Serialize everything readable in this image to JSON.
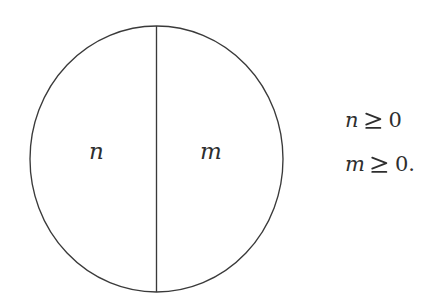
{
  "figure": {
    "width": 443,
    "height": 306,
    "background_color": "#ffffff",
    "stroke_color": "#3a3a3a",
    "text_color": "#2e2e2e",
    "type": "diagram"
  },
  "shape": {
    "name": "circle",
    "center_x": 156.5,
    "center_y": 159,
    "radius_x": 126.5,
    "radius_y": 133,
    "divider": {
      "name": "vertical-diameter",
      "x": 156.5,
      "y_top": 26,
      "y_bottom": 292
    }
  },
  "regions": [
    {
      "id": "left",
      "label": "n"
    },
    {
      "id": "right",
      "label": "m"
    }
  ],
  "conditions": [
    {
      "variable": "n",
      "relation": "≥",
      "value": "0",
      "terminator": ""
    },
    {
      "variable": "m",
      "relation": "≥",
      "value": "0",
      "terminator": "."
    }
  ]
}
